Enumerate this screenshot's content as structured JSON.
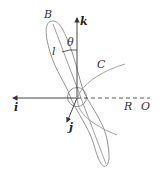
{
  "diagram": {
    "labels": {
      "blade_tip": "B",
      "axis_k": "k",
      "angle": "θ",
      "length": "l",
      "curve": "C",
      "axis_i": "i",
      "axis_j": "j",
      "radius": "R",
      "origin": "O"
    },
    "colors": {
      "axes": "#333333",
      "blade": "#888888",
      "curve": "#999999"
    }
  }
}
